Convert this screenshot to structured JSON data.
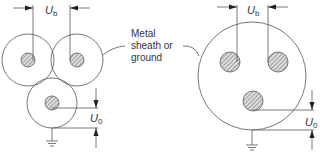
{
  "labels": {
    "ub_symbol": "U",
    "ub_sub": "b",
    "u0_symbol": "U",
    "u0_sub": "0",
    "sheath_line1": "Metal",
    "sheath_line2": "sheath or",
    "sheath_line3": "ground"
  },
  "diagrams": [
    {
      "name": "three-single-core-cables",
      "description": "Three separately sheathed cables in trefoil"
    },
    {
      "name": "three-core-cable",
      "description": "Three conductors in common metal sheath"
    }
  ],
  "colors": {
    "line": "#555555",
    "hatch": "#777777",
    "text": "#333333"
  }
}
